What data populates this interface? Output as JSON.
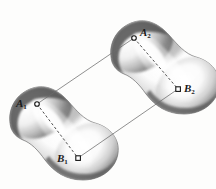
{
  "figure": {
    "kind": "geometry-diagram",
    "background_color": "#fdfdfc",
    "ink_color": "#1a1a1a",
    "line_color": "#6b6b6b",
    "body_shadow_color": "#4a4a4a",
    "body_highlight_color": "#ffffff",
    "bodies": [
      {
        "id": "body-1",
        "name": "left-body",
        "position": "lower-left"
      },
      {
        "id": "body-2",
        "name": "right-body",
        "position": "upper-right"
      }
    ],
    "points": [
      {
        "id": "A1",
        "letter": "A",
        "index": "1",
        "marker": "circle",
        "x": 37,
        "y": 104,
        "label_x": 16,
        "label_y": 98
      },
      {
        "id": "B1",
        "letter": "B",
        "index": "1",
        "marker": "square",
        "x": 78,
        "y": 158,
        "label_x": 57,
        "label_y": 158
      },
      {
        "id": "A2",
        "letter": "A",
        "index": "2",
        "marker": "circle",
        "x": 134,
        "y": 38,
        "label_x": 140,
        "label_y": 27
      },
      {
        "id": "B2",
        "letter": "B",
        "index": "2",
        "marker": "square",
        "x": 178,
        "y": 89,
        "label_x": 184,
        "label_y": 85
      }
    ],
    "connectors": [
      {
        "id": "A1-A2",
        "from": "A1",
        "to": "A2",
        "style": "solid",
        "name": "corresponding-line-a"
      },
      {
        "id": "B1-B2",
        "from": "B1",
        "to": "B2",
        "style": "solid",
        "name": "corresponding-line-b"
      },
      {
        "id": "A1-B1",
        "from": "A1",
        "to": "B1",
        "style": "dashed",
        "name": "chord-left-body"
      },
      {
        "id": "A2-B2",
        "from": "A2",
        "to": "B2",
        "style": "dashed",
        "name": "chord-right-body"
      }
    ],
    "labels": {
      "a1": "A",
      "a1_sub": "1",
      "b1": "B",
      "b1_sub": "1",
      "a2": "A",
      "a2_sub": "2",
      "b2": "B",
      "b2_sub": "2"
    }
  }
}
